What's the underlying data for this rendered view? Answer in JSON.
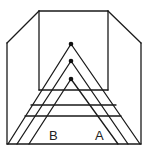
{
  "diagram": {
    "colors": {
      "line": "#1a1a1a",
      "background": "#ffffff"
    },
    "labels": [
      {
        "id": "B",
        "text": "B",
        "x": 49,
        "y": 140
      },
      {
        "id": "A",
        "text": "A",
        "x": 95,
        "y": 140
      }
    ],
    "room": {
      "back_wall": {
        "x1": 39,
        "y1": 11,
        "x2": 108,
        "y2": 90
      },
      "left_wall_top": {
        "x": 7,
        "y": 43
      },
      "right_wall_top": {
        "x": 141,
        "y": 43
      },
      "floor_y": 144
    },
    "chevrons": [
      {
        "apex": [
          71,
          44
        ],
        "left_foot": [
          8,
          144
        ],
        "right_foot": [
          140,
          144
        ]
      },
      {
        "apex": [
          71,
          61
        ],
        "left_foot": [
          17,
          144
        ],
        "right_foot": [
          128,
          144
        ]
      },
      {
        "apex": [
          71,
          79
        ],
        "left_foot": [
          29,
          144
        ],
        "right_foot": [
          118,
          144
        ]
      }
    ],
    "horizontals": [
      {
        "y": 90,
        "x1": 39,
        "x2": 108
      },
      {
        "y": 105,
        "x1": 31,
        "x2": 116
      },
      {
        "y": 116,
        "x1": 25,
        "x2": 121
      }
    ]
  }
}
